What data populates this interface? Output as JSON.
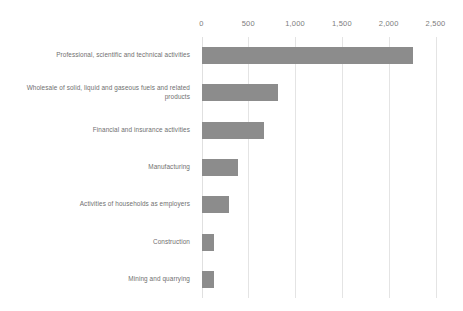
{
  "chart_data": {
    "type": "bar",
    "orientation": "horizontal",
    "title": "",
    "subtitle": "",
    "xlabel": "",
    "ylabel": "",
    "xlim": [
      0,
      2500
    ],
    "grid": true,
    "legend": false,
    "legend_position": "none",
    "bar_color": "#8c8c8c",
    "gridline_color": "#e4e4e4",
    "text_color": "#6f6f6f",
    "background": "#ffffff",
    "tick_labels": [
      "0",
      "500",
      "1,000",
      "1,500",
      "2,000",
      "2,500"
    ],
    "ticks": [
      0,
      500,
      1000,
      1500,
      2000,
      2500
    ],
    "categories": [
      "Professional, scientific and technical activities",
      "Wholesale of solid, liquid and gaseous fuels and related products",
      "Financial and insurance activities",
      "Manufacturing",
      "Activities of households as employers",
      "Construction",
      "Mining and quarrying"
    ],
    "values": [
      2255,
      815,
      670,
      385,
      295,
      130,
      130
    ]
  }
}
